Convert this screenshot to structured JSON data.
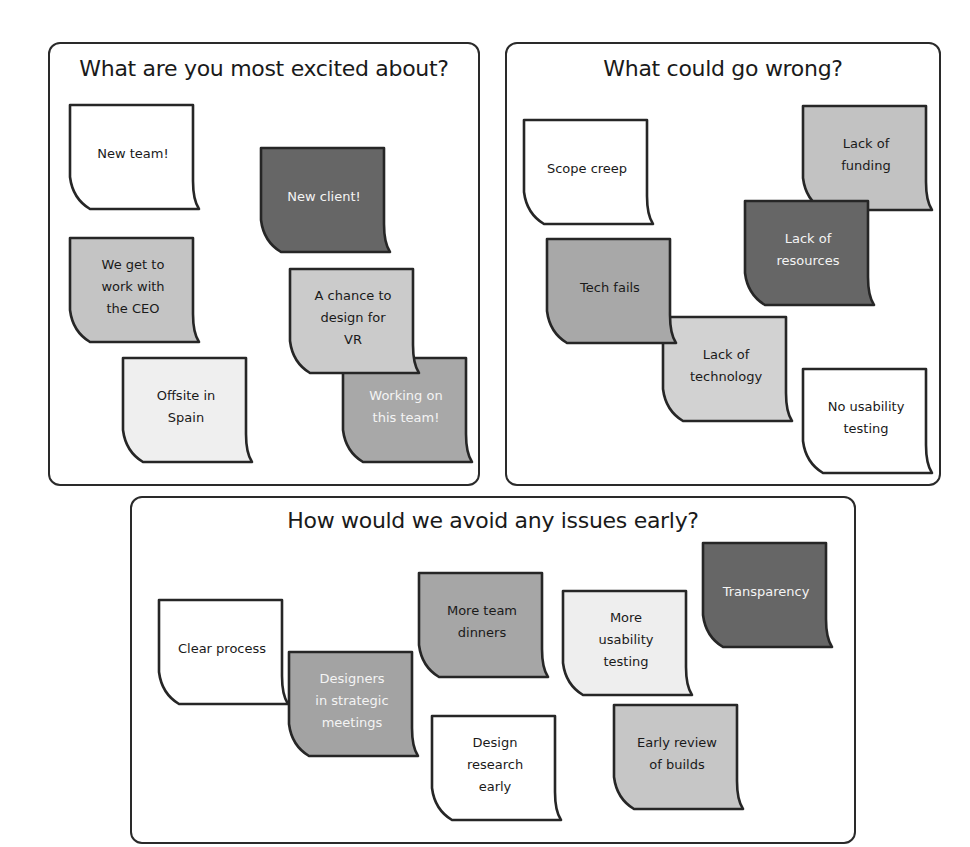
{
  "palette": {
    "white": "#ffffff",
    "pale": "#efefef",
    "light": "#cacaca",
    "medium": "#a8a8a8",
    "dark": "#666666",
    "outline": "#262626"
  },
  "panels": [
    {
      "title": "What are you most excited about?",
      "notes": [
        {
          "text": "New team!",
          "color": "#ffffff",
          "text_color": "dark"
        },
        {
          "text": "New client!",
          "color": "#666666",
          "text_color": "light"
        },
        {
          "text": "We get to\nwork with\nthe CEO",
          "color": "#c4c4c4",
          "text_color": "dark"
        },
        {
          "text": "Working on\nthis team!",
          "color": "#a8a8a8",
          "text_color": "light"
        },
        {
          "text": "A chance to\ndesign for\nVR",
          "color": "#cbcbcb",
          "text_color": "dark"
        },
        {
          "text": "Offsite in\nSpain",
          "color": "#efefef",
          "text_color": "dark"
        }
      ]
    },
    {
      "title": "What could go wrong?",
      "notes": [
        {
          "text": "Scope creep",
          "color": "#ffffff",
          "text_color": "dark"
        },
        {
          "text": "Lack of\nfunding",
          "color": "#c2c2c2",
          "text_color": "dark"
        },
        {
          "text": "Lack of\nresources",
          "color": "#666666",
          "text_color": "light"
        },
        {
          "text": "Lack of\ntechnology",
          "color": "#d2d2d2",
          "text_color": "dark"
        },
        {
          "text": "Tech fails",
          "color": "#a8a8a8",
          "text_color": "dark"
        },
        {
          "text": "No usability\ntesting",
          "color": "#ffffff",
          "text_color": "dark"
        }
      ]
    },
    {
      "title": "How would we avoid any issues early?",
      "notes": [
        {
          "text": "Clear process",
          "color": "#ffffff",
          "text_color": "dark"
        },
        {
          "text": "Designers\nin strategic\nmeetings",
          "color": "#a3a3a3",
          "text_color": "light"
        },
        {
          "text": "More team\ndinners",
          "color": "#a6a6a6",
          "text_color": "dark"
        },
        {
          "text": "More\nusability\ntesting",
          "color": "#eeeeee",
          "text_color": "dark"
        },
        {
          "text": "Transparency",
          "color": "#666666",
          "text_color": "light"
        },
        {
          "text": "Design\nresearch\nearly",
          "color": "#ffffff",
          "text_color": "dark"
        },
        {
          "text": "Early review\nof builds",
          "color": "#c6c6c6",
          "text_color": "dark"
        }
      ]
    }
  ]
}
